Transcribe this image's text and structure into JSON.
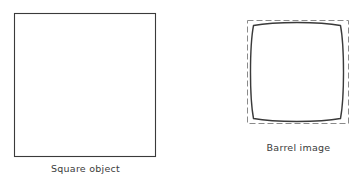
{
  "figure": {
    "type": "optics-distortion-diagram",
    "background_color": "#ffffff",
    "line_color": "#3a3a3a",
    "dashed_line_color": "#8a8a8a",
    "caption_color": "#3b3b3b",
    "panels": [
      {
        "id": "square-object",
        "caption": "Square object",
        "shape": "square",
        "stroke": "solid",
        "stroke_color": "#3a3a3a",
        "stroke_width": 1,
        "fill": "none",
        "bounds": {
          "x": 14,
          "y": 13,
          "width": 142,
          "height": 144
        }
      },
      {
        "id": "barrel-image",
        "caption": "Barrel image",
        "shape": "barrel-distorted-square",
        "stroke": "solid",
        "stroke_color": "#3a3a3a",
        "stroke_width": 1.4,
        "fill": "none",
        "bounds": {
          "x": 253,
          "y": 25,
          "width": 88,
          "height": 94
        },
        "bulge_amount_px": 4,
        "reference_outline": {
          "id": "undistorted-reference",
          "shape": "square",
          "stroke": "dashed",
          "stroke_color": "#8a8a8a",
          "stroke_width": 1,
          "dash_pattern": "6 3",
          "fill": "none",
          "bounds": {
            "x": 247,
            "y": 20,
            "width": 102,
            "height": 104
          }
        }
      }
    ]
  },
  "captions": {
    "square_object": "Square object",
    "barrel_image": "Barrel image"
  }
}
